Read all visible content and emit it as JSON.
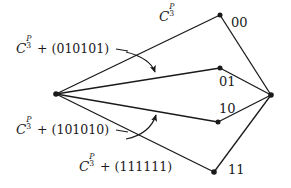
{
  "figure": {
    "background_color": "#ffffff",
    "ink_color": "#1a1a1a",
    "width": 291,
    "height": 188,
    "coset_symbol": {
      "base": "C",
      "subscript": "3",
      "superscript": "P"
    },
    "labels": {
      "top_coset": {
        "base": "C",
        "sub": "3",
        "sup": "P",
        "offset": ""
      },
      "upper_coset": {
        "base": "C",
        "sub": "3",
        "sup": "P",
        "offset": " + (010101)"
      },
      "lower_coset": {
        "base": "C",
        "sub": "3",
        "sup": "P",
        "offset": " + (101010)"
      },
      "bottom_coset": {
        "base": "C",
        "sub": "3",
        "sup": "P",
        "offset": " + (111111)"
      }
    },
    "vertex_labels": [
      {
        "name": "vertex-label-00",
        "text": "00"
      },
      {
        "name": "vertex-label-01",
        "text": "01"
      },
      {
        "name": "vertex-label-10",
        "text": "10"
      },
      {
        "name": "vertex-label-11",
        "text": "11"
      }
    ],
    "vertices": [
      {
        "name": "left-apex-vertex",
        "x": 56,
        "y": 94
      },
      {
        "name": "top-vertex-00",
        "x": 220,
        "y": 15
      },
      {
        "name": "mid-upper-vertex-01",
        "x": 220,
        "y": 68
      },
      {
        "name": "mid-lower-vertex-10",
        "x": 218,
        "y": 122
      },
      {
        "name": "bottom-vertex-11",
        "x": 214,
        "y": 172
      },
      {
        "name": "right-apex-vertex",
        "x": 271,
        "y": 95
      }
    ],
    "edges": [
      {
        "name": "edge-apex-to-00",
        "x1": 56,
        "y1": 94,
        "x2": 220,
        "y2": 15
      },
      {
        "name": "edge-apex-to-01",
        "x1": 56,
        "y1": 94,
        "x2": 220,
        "y2": 68
      },
      {
        "name": "edge-apex-to-10",
        "x1": 56,
        "y1": 94,
        "x2": 218,
        "y2": 122
      },
      {
        "name": "edge-apex-to-11",
        "x1": 56,
        "y1": 94,
        "x2": 214,
        "y2": 172
      },
      {
        "name": "edge-00-to-right",
        "x1": 220,
        "y1": 15,
        "x2": 271,
        "y2": 95
      },
      {
        "name": "edge-01-to-right",
        "x1": 220,
        "y1": 68,
        "x2": 271,
        "y2": 95
      },
      {
        "name": "edge-10-to-right",
        "x1": 218,
        "y1": 122,
        "x2": 271,
        "y2": 95
      },
      {
        "name": "edge-11-to-right",
        "x1": 214,
        "y1": 172,
        "x2": 271,
        "y2": 95
      }
    ],
    "arrows": [
      {
        "name": "upper-curved-arrow",
        "path": "M 125 53 Q 147 60 154 73"
      },
      {
        "name": "lower-curved-arrow",
        "path": "M 125 139 Q 148 133 156 114"
      }
    ],
    "leaders": [
      {
        "name": "upper-label-leader",
        "x1": 117,
        "y1": 50,
        "x2": 127,
        "y2": 52
      },
      {
        "name": "lower-label-leader",
        "x1": 117,
        "y1": 131,
        "x2": 127,
        "y2": 133
      }
    ]
  }
}
